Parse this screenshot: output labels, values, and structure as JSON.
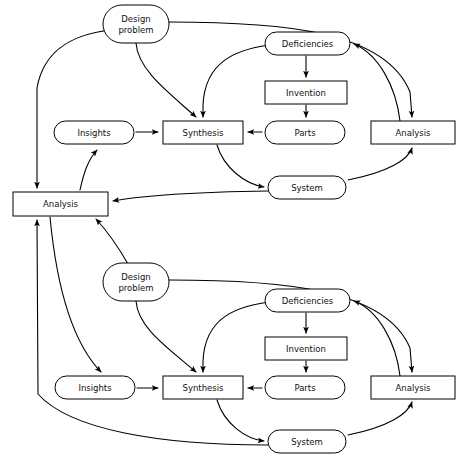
{
  "diagram": {
    "background_color": "#ffffff",
    "line_color": "#000000",
    "text_color": "#111111",
    "width": 461,
    "height": 468,
    "nodes": [
      {
        "id": "design-problem-1",
        "label": "Design problem",
        "line1": "Design",
        "line2": "problem",
        "shape": "stadium",
        "x": 103,
        "y": 5,
        "w": 66,
        "h": 38,
        "cycle": "upper"
      },
      {
        "id": "deficiencies-1",
        "label": "Deficiencies",
        "shape": "stadium",
        "x": 265,
        "y": 32,
        "w": 85,
        "h": 23,
        "cycle": "upper"
      },
      {
        "id": "invention-1",
        "label": "Invention",
        "shape": "rect",
        "x": 265,
        "y": 81,
        "w": 82,
        "h": 23,
        "cycle": "upper"
      },
      {
        "id": "insights-1",
        "label": "Insights",
        "shape": "stadium",
        "x": 54,
        "y": 121,
        "w": 80,
        "h": 23,
        "cycle": "upper"
      },
      {
        "id": "synthesis-1",
        "label": "Synthesis",
        "shape": "rect",
        "x": 163,
        "y": 121,
        "w": 80,
        "h": 23,
        "cycle": "upper"
      },
      {
        "id": "parts-1",
        "label": "Parts",
        "shape": "stadium",
        "x": 265,
        "y": 121,
        "w": 80,
        "h": 23,
        "cycle": "upper"
      },
      {
        "id": "analysis-right-1",
        "label": "Analysis",
        "shape": "rect",
        "x": 371,
        "y": 121,
        "w": 84,
        "h": 23,
        "cycle": "upper"
      },
      {
        "id": "system-1",
        "label": "System",
        "shape": "stadium",
        "x": 268,
        "y": 176,
        "w": 78,
        "h": 23,
        "cycle": "upper"
      },
      {
        "id": "analysis-left",
        "label": "Analysis",
        "shape": "rect",
        "x": 13,
        "y": 192,
        "w": 95,
        "h": 24,
        "cycle": "shared"
      },
      {
        "id": "design-problem-2",
        "label": "Design problem",
        "line1": "Design",
        "line2": "problem",
        "shape": "stadium",
        "x": 103,
        "y": 263,
        "w": 66,
        "h": 38,
        "cycle": "lower"
      },
      {
        "id": "deficiencies-2",
        "label": "Deficiencies",
        "shape": "stadium",
        "x": 265,
        "y": 289,
        "w": 85,
        "h": 23,
        "cycle": "lower"
      },
      {
        "id": "invention-2",
        "label": "Invention",
        "shape": "rect",
        "x": 265,
        "y": 337,
        "w": 82,
        "h": 23,
        "cycle": "lower"
      },
      {
        "id": "insights-2",
        "label": "Insights",
        "shape": "stadium",
        "x": 55,
        "y": 376,
        "w": 80,
        "h": 23,
        "cycle": "lower"
      },
      {
        "id": "synthesis-2",
        "label": "Synthesis",
        "shape": "rect",
        "x": 163,
        "y": 376,
        "w": 80,
        "h": 23,
        "cycle": "lower"
      },
      {
        "id": "parts-2",
        "label": "Parts",
        "shape": "stadium",
        "x": 265,
        "y": 376,
        "w": 80,
        "h": 23,
        "cycle": "lower"
      },
      {
        "id": "analysis-right-2",
        "label": "Analysis",
        "shape": "rect",
        "x": 371,
        "y": 376,
        "w": 84,
        "h": 23,
        "cycle": "lower"
      },
      {
        "id": "system-2",
        "label": "System",
        "shape": "stadium",
        "x": 268,
        "y": 430,
        "w": 78,
        "h": 23,
        "cycle": "lower"
      }
    ],
    "edges": [
      {
        "id": "e1",
        "from": "design-problem-1",
        "to": "analysis-left",
        "arrow": true
      },
      {
        "id": "e2",
        "from": "design-problem-1",
        "to": "synthesis-1",
        "arrow": true
      },
      {
        "id": "e3",
        "from": "design-problem-1",
        "to": "analysis-right-1",
        "arrow": true
      },
      {
        "id": "e4",
        "from": "deficiencies-1",
        "to": "invention-1",
        "arrow": true
      },
      {
        "id": "e5",
        "from": "invention-1",
        "to": "parts-1",
        "arrow": true
      },
      {
        "id": "e6",
        "from": "parts-1",
        "to": "synthesis-1",
        "arrow": true
      },
      {
        "id": "e7",
        "from": "deficiencies-1",
        "to": "synthesis-1",
        "arrow": true
      },
      {
        "id": "e8",
        "from": "insights-1",
        "to": "synthesis-1",
        "arrow": true
      },
      {
        "id": "e9",
        "from": "synthesis-1",
        "to": "system-1",
        "arrow": true
      },
      {
        "id": "e10",
        "from": "system-1",
        "to": "analysis-right-1",
        "arrow": true
      },
      {
        "id": "e11",
        "from": "analysis-right-1",
        "to": "deficiencies-1",
        "arrow": true
      },
      {
        "id": "e12",
        "from": "system-1",
        "to": "analysis-left",
        "arrow": true
      },
      {
        "id": "e13",
        "from": "analysis-left",
        "to": "insights-1",
        "arrow": true
      },
      {
        "id": "e14",
        "from": "analysis-left",
        "to": "insights-2",
        "arrow": true
      },
      {
        "id": "e15",
        "from": "design-problem-2",
        "to": "analysis-left",
        "arrow": true
      },
      {
        "id": "e16",
        "from": "design-problem-2",
        "to": "synthesis-2",
        "arrow": true
      },
      {
        "id": "e17",
        "from": "design-problem-2",
        "to": "analysis-right-2",
        "arrow": true
      },
      {
        "id": "e18",
        "from": "deficiencies-2",
        "to": "invention-2",
        "arrow": true
      },
      {
        "id": "e19",
        "from": "invention-2",
        "to": "parts-2",
        "arrow": true
      },
      {
        "id": "e20",
        "from": "parts-2",
        "to": "synthesis-2",
        "arrow": true
      },
      {
        "id": "e21",
        "from": "deficiencies-2",
        "to": "synthesis-2",
        "arrow": true
      },
      {
        "id": "e22",
        "from": "insights-2",
        "to": "synthesis-2",
        "arrow": true
      },
      {
        "id": "e23",
        "from": "synthesis-2",
        "to": "system-2",
        "arrow": true
      },
      {
        "id": "e24",
        "from": "system-2",
        "to": "analysis-right-2",
        "arrow": true
      },
      {
        "id": "e25",
        "from": "analysis-right-2",
        "to": "deficiencies-2",
        "arrow": true
      },
      {
        "id": "e26",
        "from": "system-2",
        "to": "analysis-left",
        "arrow": true
      }
    ],
    "edge_paths": {
      "e1": "M 111,30 C 75,34 44,48 37,88 L 37,188",
      "e2": "M 136,43 C 138,70 168,92 196,117",
      "e3": "M 169,22 C 280,22 385,30 410,92 L 412,117",
      "e4": "M 306,56 L 306,77",
      "e5": "M 306,105 L 306,117",
      "e6": "M 262,132 L 248,132",
      "e7": "M 278,44 C 235,48 205,62 203,105 L 203,117",
      "e8": "M 136,132 L 158,132",
      "e9": "M 217,145 C 224,168 245,184 264,187",
      "e10": "M 348,180 C 388,172 408,160 412,148",
      "e11": "M 400,121 C 396,86 378,54 354,44",
      "e12": "M 268,191 C 200,192 140,196 113,201",
      "e13": "M 80,190 C 84,172 88,160 97,150",
      "e14": "M 50,217 C 56,280 70,340 101,372",
      "e15": "M 128,264 C 120,250 108,232 96,219",
      "e16": "M 136,301 C 138,328 168,348 196,372",
      "e17": "M 169,280 C 280,280 385,288 410,348 L 412,372",
      "e18": "M 306,313 L 306,333",
      "e19": "M 306,361 L 306,372",
      "e20": "M 262,388 L 248,388",
      "e21": "M 278,301 C 235,305 205,318 203,361 L 203,372",
      "e22": "M 137,388 L 158,388",
      "e23": "M 217,400 C 224,423 245,439 264,441",
      "e24": "M 348,435 C 388,427 408,414 412,402",
      "e25": "M 400,376 C 396,342 378,310 354,301",
      "e26": "M 268,445 C 160,445 70,430 38,394 L 37,220"
    }
  }
}
